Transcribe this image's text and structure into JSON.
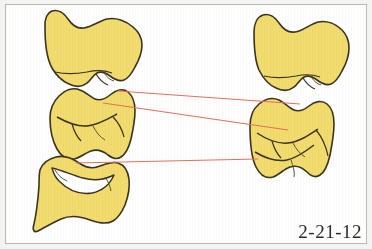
{
  "figure": {
    "label": "2-21-12",
    "colors": {
      "tooth_fill": "#f1dc6d",
      "tooth_outline": "#3a3322",
      "connector_line": "#e8705a",
      "background": "#ffffff",
      "frame_border": "#b9b9b5",
      "page_backdrop": "#f3f3f1"
    },
    "teeth": [
      {
        "id": "top-left",
        "name": "molar-crown-top-left"
      },
      {
        "id": "top-right",
        "name": "molar-crown-top-right"
      },
      {
        "id": "middle-left",
        "name": "molar-crown-middle-left"
      },
      {
        "id": "middle-right",
        "name": "molar-crown-middle-right"
      },
      {
        "id": "bottom-left",
        "name": "molar-crown-bottom-left"
      }
    ],
    "connectors": [
      {
        "id": "connector-1",
        "x1": 118,
        "y1": 91,
        "x2": 300,
        "y2": 104
      },
      {
        "id": "connector-2",
        "x1": 103,
        "y1": 103,
        "x2": 288,
        "y2": 130
      },
      {
        "id": "connector-3",
        "x1": 76,
        "y1": 163,
        "x2": 258,
        "y2": 159
      }
    ]
  }
}
